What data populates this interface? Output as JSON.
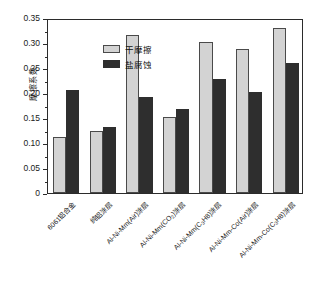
{
  "chart_data": {
    "type": "bar",
    "title": "",
    "xlabel": "",
    "ylabel": "摩擦系数",
    "ylim": [
      0,
      0.35
    ],
    "ytick_labels": [
      "0",
      "0.05",
      "0.10",
      "0.15",
      "0.20",
      "0.25",
      "0.30",
      "0.35"
    ],
    "ytick_values": [
      0,
      0.05,
      0.1,
      0.15,
      0.2,
      0.25,
      0.3,
      0.35
    ],
    "grid": false,
    "legend_position": "upper-left",
    "categories": [
      "6061铝合金",
      "纯铝涂层",
      "Al-Ni-Mm(Air)涂层",
      "Al-Ni-Mm(CO2)涂层",
      "Al-Ni-Mm(C3H8)涂层",
      "Al-Ni-Mm-Co(Air)涂层",
      "Al-Ni-Mm-Co(C3H8)涂层"
    ],
    "series": [
      {
        "name": "干摩擦",
        "color": "#d3d3d3",
        "values": [
          0.112,
          0.124,
          0.317,
          0.153,
          0.302,
          0.289,
          0.33
        ]
      },
      {
        "name": "盐腐蚀",
        "color": "#2e2e2e",
        "values": [
          0.206,
          0.132,
          0.192,
          0.168,
          0.228,
          0.203,
          0.26
        ]
      }
    ]
  },
  "axis": {
    "y_label": "摩擦系数",
    "y_ticks": [
      "0.35",
      "0.30",
      "0.25",
      "0.20",
      "0.15",
      "0.10",
      "0.05",
      "0"
    ]
  },
  "legend": {
    "items": [
      {
        "label": "干摩擦",
        "swatch": "dry"
      },
      {
        "label": "盐腐蚀",
        "swatch": "salt"
      }
    ]
  },
  "x_labels": [
    {
      "pre": "6061铝合金",
      "sub": "",
      "post": ""
    },
    {
      "pre": "纯铝涂层",
      "sub": "",
      "post": ""
    },
    {
      "pre": "Al-Ni-Mm(Air)涂层",
      "sub": "",
      "post": ""
    },
    {
      "pre": "Al-Ni-Mm(CO",
      "sub": "2",
      "post": ")涂层"
    },
    {
      "pre": "Al-Ni-Mm(C",
      "sub": "3",
      "post": "H8)涂层"
    },
    {
      "pre": "Al-Ni-Mm-Co(Air)涂层",
      "sub": "",
      "post": ""
    },
    {
      "pre": "Al-Ni-Mm-Co(C",
      "sub": "3",
      "post": "H8)涂层"
    }
  ]
}
